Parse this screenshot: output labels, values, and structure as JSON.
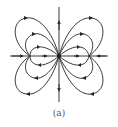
{
  "figure": {
    "caption": "(a)",
    "type": "phase portrait / dipole-like field lines",
    "stroke_color": "#222222",
    "background": "#ffffff",
    "center": {
      "x": 59,
      "y": 56
    },
    "axes": {
      "horizontal": {
        "x1": 10,
        "x2": 108,
        "y": 56
      },
      "vertical": {
        "x": 59,
        "y1": 7,
        "y2": 102
      }
    },
    "loops": [
      {
        "side": "right-upper",
        "size": "large"
      },
      {
        "side": "right-upper",
        "size": "medium"
      },
      {
        "side": "right-upper",
        "size": "small"
      },
      {
        "side": "right-lower",
        "size": "large"
      },
      {
        "side": "right-lower",
        "size": "medium"
      },
      {
        "side": "right-lower",
        "size": "small"
      },
      {
        "side": "left-upper",
        "size": "large"
      },
      {
        "side": "left-upper",
        "size": "medium"
      },
      {
        "side": "left-upper",
        "size": "small"
      },
      {
        "side": "left-lower",
        "size": "large"
      },
      {
        "side": "left-lower",
        "size": "medium"
      },
      {
        "side": "left-lower",
        "size": "small"
      }
    ]
  }
}
